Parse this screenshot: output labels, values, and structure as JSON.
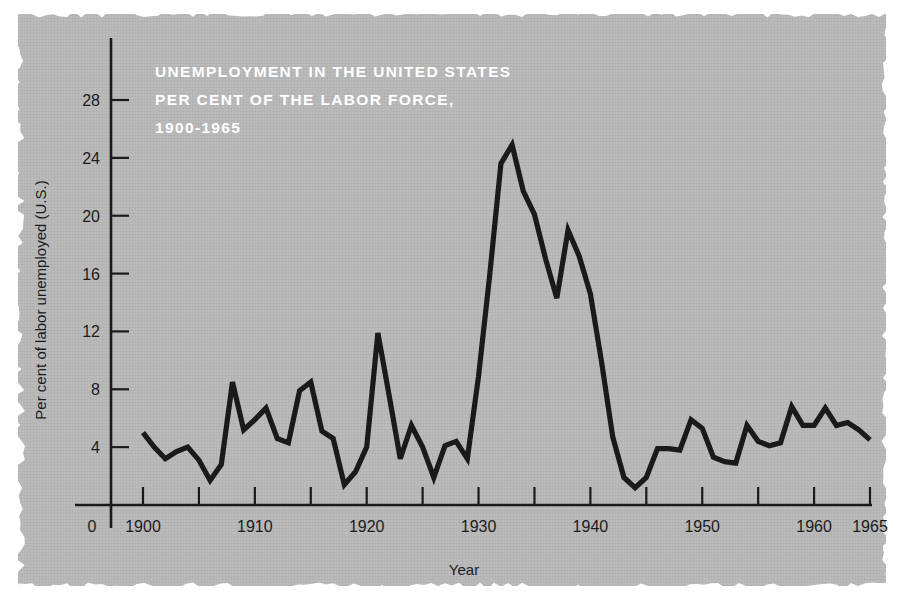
{
  "figure": {
    "background_color": "#b9b9b9",
    "ink_color": "#1a1a1a",
    "title_color": "#ffffff",
    "title_lines": [
      "UNEMPLOYMENT IN THE UNITED STATES",
      "PER CENT OF THE LABOR FORCE,",
      "1900-1965"
    ]
  },
  "chart_data": {
    "type": "line",
    "title": "UNEMPLOYMENT IN THE UNITED STATES PER CENT OF THE LABOR FORCE, 1900-1965",
    "xlabel": "Year",
    "ylabel": "Per cent of labor unemployed (U.S.)",
    "xlim": [
      1899,
      1966
    ],
    "ylim": [
      0,
      30
    ],
    "grid": false,
    "legend": null,
    "x_tick_labels": [
      "0",
      "1900",
      "1910",
      "1920",
      "1930",
      "1940",
      "1950",
      "1960",
      "1965"
    ],
    "x_major_ticks": [
      1900,
      1905,
      1910,
      1915,
      1920,
      1925,
      1930,
      1935,
      1940,
      1945,
      1950,
      1955,
      1960,
      1965
    ],
    "x_labeled_ticks": [
      1900,
      1910,
      1920,
      1930,
      1940,
      1950,
      1960,
      1965
    ],
    "y_tick_labels": [
      "4",
      "8",
      "12",
      "16",
      "20",
      "24",
      "28"
    ],
    "y_ticks": [
      4,
      8,
      12,
      16,
      20,
      24,
      28
    ],
    "series": [
      {
        "name": "Per cent of labor unemployed (U.S.)",
        "color": "#1a1a1a",
        "x": [
          1900,
          1901,
          1902,
          1903,
          1904,
          1905,
          1906,
          1907,
          1908,
          1909,
          1910,
          1911,
          1912,
          1913,
          1914,
          1915,
          1916,
          1917,
          1918,
          1919,
          1920,
          1921,
          1922,
          1923,
          1924,
          1925,
          1926,
          1927,
          1928,
          1929,
          1930,
          1931,
          1932,
          1933,
          1934,
          1935,
          1936,
          1937,
          1938,
          1939,
          1940,
          1941,
          1942,
          1943,
          1944,
          1945,
          1946,
          1947,
          1948,
          1949,
          1950,
          1951,
          1952,
          1953,
          1954,
          1955,
          1956,
          1957,
          1958,
          1959,
          1960,
          1961,
          1962,
          1963,
          1964,
          1965
        ],
        "y": [
          5.0,
          4.0,
          3.2,
          3.7,
          4.0,
          3.1,
          1.7,
          2.8,
          8.5,
          5.2,
          5.9,
          6.7,
          4.6,
          4.3,
          7.9,
          8.5,
          5.1,
          4.6,
          1.4,
          2.3,
          4.0,
          11.9,
          7.6,
          3.2,
          5.5,
          4.0,
          1.9,
          4.1,
          4.4,
          3.2,
          8.9,
          15.9,
          23.6,
          24.9,
          21.7,
          20.1,
          17.0,
          14.3,
          19.0,
          17.2,
          14.6,
          9.9,
          4.7,
          1.9,
          1.2,
          1.9,
          3.9,
          3.9,
          3.8,
          5.9,
          5.3,
          3.3,
          3.0,
          2.9,
          5.5,
          4.4,
          4.1,
          4.3,
          6.8,
          5.5,
          5.5,
          6.7,
          5.5,
          5.7,
          5.2,
          4.5
        ]
      }
    ]
  }
}
